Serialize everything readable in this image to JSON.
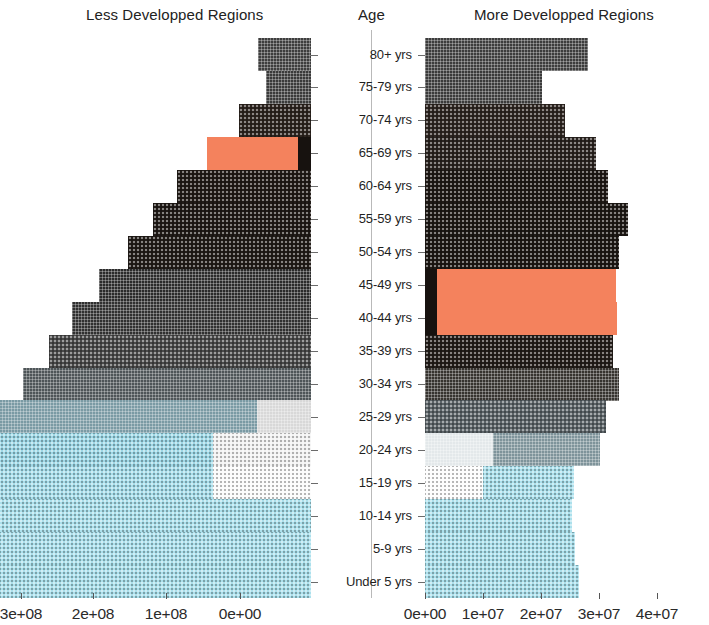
{
  "chart_data": {
    "type": "bar",
    "subtitle": "",
    "orientation": "horizontal",
    "layout": "butterfly-population-pyramid",
    "grid": false,
    "legend_position": "none",
    "panels": [
      {
        "name": "left",
        "title": "Less Developped Regions",
        "direction": "left",
        "xlabel": "",
        "ylabel": "Age",
        "xlim": [
          0,
          300000000
        ],
        "tick_values": [
          300000000,
          200000000,
          100000000,
          0
        ],
        "tick_labels": [
          "3e+08",
          "2e+08",
          "1e+08",
          "0e+00"
        ]
      },
      {
        "name": "right",
        "title": "More Developped Regions",
        "direction": "right",
        "xlabel": "",
        "ylabel": "Age",
        "xlim": [
          0,
          40000000
        ],
        "tick_values": [
          0,
          10000000,
          20000000,
          30000000,
          40000000
        ],
        "tick_labels": [
          "0e+00",
          "1e+07",
          "2e+07",
          "3e+07",
          "4e+07"
        ]
      }
    ],
    "categories": [
      "80+ yrs",
      "75-79 yrs",
      "70-74 yrs",
      "65-69 yrs",
      "60-64 yrs",
      "55-59 yrs",
      "50-54 yrs",
      "45-49 yrs",
      "40-44 yrs",
      "35-39 yrs",
      "30-34 yrs",
      "25-29 yrs",
      "20-24 yrs",
      "15-19 yrs",
      "10-14 yrs",
      "5-9 yrs",
      "Under 5 yrs"
    ],
    "series": [
      {
        "name": "Less Developped Regions",
        "panel": "left",
        "values": [
          37000000,
          31000000,
          50000000,
          72000000,
          93000000,
          110000000,
          127000000,
          148000000,
          166000000,
          182000000,
          200000000,
          229000000,
          253000000,
          253000000,
          271000000,
          282000000,
          288000000
        ]
      },
      {
        "name": "More Developped Regions",
        "panel": "right",
        "values": [
          34000000,
          24500000,
          29300000,
          35800000,
          38200000,
          42400000,
          40500000,
          39900000,
          40100000,
          39300000,
          40400000,
          37700000,
          36500000,
          31100000,
          30700000,
          31400000,
          32200000
        ]
      }
    ],
    "highlight": {
      "color": "#F4825D",
      "label": "highlighted cohorts",
      "left_panel_rows": [
        "65-69 yrs"
      ],
      "right_panel_rows": [
        "45-49 yrs",
        "40-44 yrs"
      ]
    },
    "color_ramp": {
      "oldest": "#3a3a3a",
      "mid": "#5e6a6e",
      "youngest": "#ACE0EC",
      "highlight": "#F4825D"
    }
  },
  "titles": {
    "left": "Less Developped Regions",
    "age": "Age",
    "right": "More Developped Regions"
  },
  "left_axis": {
    "ticks": [
      {
        "label": "3e+08",
        "x": 21
      },
      {
        "label": "2e+08",
        "x": 93
      },
      {
        "label": "1e+08",
        "x": 166
      },
      {
        "label": "0e+00",
        "x": 240
      }
    ]
  },
  "right_axis": {
    "ticks": [
      {
        "label": "0e+00",
        "x": 425
      },
      {
        "label": "1e+07",
        "x": 483
      },
      {
        "label": "2e+07",
        "x": 541
      },
      {
        "label": "3e+07",
        "x": 599
      },
      {
        "label": "4e+07",
        "x": 657
      }
    ]
  },
  "rows": [
    {
      "age": "80+ yrs",
      "left": {
        "width": 53,
        "segments": [
          {
            "w": 53,
            "color": "#3d3d3d",
            "pattern": "grid"
          }
        ]
      },
      "right": {
        "width": 163,
        "segments": [
          {
            "w": 163,
            "color": "#3c3c3c",
            "pattern": "grid"
          }
        ]
      }
    },
    {
      "age": "75-79 yrs",
      "left": {
        "width": 45,
        "segments": [
          {
            "w": 45,
            "color": "#3a3a3a",
            "pattern": "grid"
          }
        ]
      },
      "right": {
        "width": 117,
        "segments": [
          {
            "w": 117,
            "color": "#3a3a3a",
            "pattern": "grid"
          }
        ]
      }
    },
    {
      "age": "70-74 yrs",
      "left": {
        "width": 72,
        "segments": [
          {
            "w": 72,
            "color": "#2e2520",
            "pattern": "dots"
          }
        ]
      },
      "right": {
        "width": 140,
        "segments": [
          {
            "w": 140,
            "color": "#2f2722",
            "pattern": "dots"
          }
        ]
      }
    },
    {
      "age": "65-69 yrs",
      "left": {
        "width": 104,
        "segments": [
          {
            "w": 91,
            "color": "#F4825D",
            "pattern": "solid"
          },
          {
            "w": 13,
            "color": "#17120f",
            "pattern": "solid"
          }
        ]
      },
      "right": {
        "width": 171,
        "segments": [
          {
            "w": 171,
            "color": "#2b2420",
            "pattern": "dots"
          }
        ]
      }
    },
    {
      "age": "60-64 yrs",
      "left": {
        "width": 134,
        "segments": [
          {
            "w": 134,
            "color": "#221c18",
            "pattern": "dots"
          }
        ]
      },
      "right": {
        "width": 183,
        "segments": [
          {
            "w": 183,
            "color": "#201a16",
            "pattern": "dots"
          }
        ]
      }
    },
    {
      "age": "55-59 yrs",
      "left": {
        "width": 158,
        "segments": [
          {
            "w": 158,
            "color": "#211b17",
            "pattern": "dots"
          }
        ]
      },
      "right": {
        "width": 203,
        "segments": [
          {
            "w": 203,
            "color": "#1f1a16",
            "pattern": "dots"
          }
        ]
      }
    },
    {
      "age": "50-54 yrs",
      "left": {
        "width": 183,
        "segments": [
          {
            "w": 183,
            "color": "#231d19",
            "pattern": "dots"
          }
        ]
      },
      "right": {
        "width": 194,
        "segments": [
          {
            "w": 194,
            "color": "#1e1915",
            "pattern": "dots"
          }
        ]
      }
    },
    {
      "age": "45-49 yrs",
      "left": {
        "width": 212,
        "segments": [
          {
            "w": 212,
            "color": "#2b2b2b",
            "pattern": "grid"
          }
        ]
      },
      "right": {
        "width": 191,
        "segments": [
          {
            "w": 12,
            "color": "#17120f",
            "pattern": "solid"
          },
          {
            "w": 179,
            "color": "#F4825D",
            "pattern": "solid"
          }
        ]
      }
    },
    {
      "age": "40-44 yrs",
      "left": {
        "width": 239,
        "segments": [
          {
            "w": 239,
            "color": "#303030",
            "pattern": "grid"
          }
        ]
      },
      "right": {
        "width": 192,
        "segments": [
          {
            "w": 12,
            "color": "#17120f",
            "pattern": "solid"
          },
          {
            "w": 180,
            "color": "#F4825D",
            "pattern": "solid"
          }
        ]
      }
    },
    {
      "age": "35-39 yrs",
      "left": {
        "width": 262,
        "segments": [
          {
            "w": 262,
            "color": "#4a4a4a",
            "pattern": "dots"
          }
        ]
      },
      "right": {
        "width": 188,
        "segments": [
          {
            "w": 188,
            "color": "#241e1a",
            "pattern": "dots"
          }
        ]
      }
    },
    {
      "age": "30-34 yrs",
      "left": {
        "width": 288,
        "segments": [
          {
            "w": 288,
            "color": "#4e5558",
            "pattern": "grid"
          }
        ]
      },
      "right": {
        "width": 194,
        "segments": [
          {
            "w": 194,
            "color": "#36332f",
            "pattern": "grid"
          }
        ]
      }
    },
    {
      "age": "25-29 yrs",
      "left": {
        "width": 330,
        "segments": [
          {
            "w": 276,
            "color": "#7a9aa4",
            "pattern": "grid"
          },
          {
            "w": 54,
            "color": "#d8d8d8",
            "pattern": "grid"
          }
        ]
      },
      "right": {
        "width": 181,
        "segments": [
          {
            "w": 181,
            "color": "#5c6468",
            "pattern": "dots"
          }
        ]
      }
    },
    {
      "age": "20-24 yrs",
      "left": {
        "width": 365,
        "segments": [
          {
            "w": 267,
            "color": "#9FD8E6",
            "pattern": "dots"
          },
          {
            "w": 98,
            "color": "#f2f2f2",
            "pattern": "dots"
          }
        ]
      },
      "right": {
        "width": 175,
        "segments": [
          {
            "w": 68,
            "color": "#e3e8ea",
            "pattern": "grid"
          },
          {
            "w": 107,
            "color": "#7e939a",
            "pattern": "grid"
          }
        ]
      }
    },
    {
      "age": "15-19 yrs",
      "left": {
        "width": 365,
        "segments": [
          {
            "w": 267,
            "color": "#A8DEEB",
            "pattern": "dots"
          },
          {
            "w": 98,
            "color": "#fbfbfb",
            "pattern": "dots"
          }
        ]
      },
      "right": {
        "width": 149,
        "segments": [
          {
            "w": 58,
            "color": "#fdfdfd",
            "pattern": "dots"
          },
          {
            "w": 91,
            "color": "#ACE0EC",
            "pattern": "dots"
          }
        ]
      }
    },
    {
      "age": "10-14 yrs",
      "left": {
        "width": 324,
        "segments": [
          {
            "w": 324,
            "color": "#ACE0EC",
            "pattern": "dots"
          }
        ]
      },
      "right": {
        "width": 147,
        "segments": [
          {
            "w": 147,
            "color": "#ACE0EC",
            "pattern": "dots"
          }
        ]
      }
    },
    {
      "age": "5-9 yrs",
      "left": {
        "width": 339,
        "segments": [
          {
            "w": 339,
            "color": "#ACE0EC",
            "pattern": "dots"
          }
        ]
      },
      "right": {
        "width": 150,
        "segments": [
          {
            "w": 150,
            "color": "#ACE0EC",
            "pattern": "dots"
          }
        ]
      }
    },
    {
      "age": "Under 5 yrs",
      "left": {
        "width": 347,
        "segments": [
          {
            "w": 347,
            "color": "#ACE0EC",
            "pattern": "dots"
          }
        ]
      },
      "right": {
        "width": 154,
        "segments": [
          {
            "w": 154,
            "color": "#ACE0EC",
            "pattern": "dots"
          }
        ]
      }
    }
  ]
}
